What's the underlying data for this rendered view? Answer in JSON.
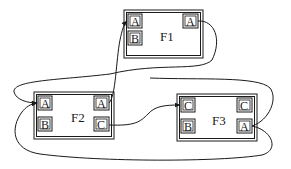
{
  "diagram": {
    "type": "port-connection diagram",
    "colors": {
      "stroke": "#1a1a1a",
      "background": "#ffffff",
      "box_fill": "#ffffff"
    },
    "frames": [
      {
        "id": "F1",
        "label": "F1",
        "ports": [
          {
            "id": "F1.A.left",
            "label": "A",
            "side": "left"
          },
          {
            "id": "F1.B",
            "label": "B",
            "side": "left"
          },
          {
            "id": "F1.A.right",
            "label": "A",
            "side": "right"
          }
        ]
      },
      {
        "id": "F2",
        "label": "F2",
        "ports": [
          {
            "id": "F2.A.left",
            "label": "A",
            "side": "left"
          },
          {
            "id": "F2.B",
            "label": "B",
            "side": "left"
          },
          {
            "id": "F2.A.right",
            "label": "A",
            "side": "right"
          },
          {
            "id": "F2.C",
            "label": "C",
            "side": "right"
          }
        ]
      },
      {
        "id": "F3",
        "label": "F3",
        "ports": [
          {
            "id": "F3.C.left",
            "label": "C",
            "side": "left"
          },
          {
            "id": "F3.B",
            "label": "B",
            "side": "left"
          },
          {
            "id": "F3.C.right",
            "label": "C",
            "side": "right"
          },
          {
            "id": "F3.A",
            "label": "A",
            "side": "right"
          }
        ]
      }
    ],
    "edges": [
      {
        "from": "F2.A.right",
        "to": "F1.A.left",
        "arrow": true
      },
      {
        "from": "F1.A.right",
        "to": "F2.A.left",
        "arrow": true
      },
      {
        "from": "F2.C",
        "to": "F3.C.left",
        "arrow": true
      },
      {
        "from": "F3.A",
        "to": "F2.A.left",
        "arrow": true
      }
    ]
  }
}
